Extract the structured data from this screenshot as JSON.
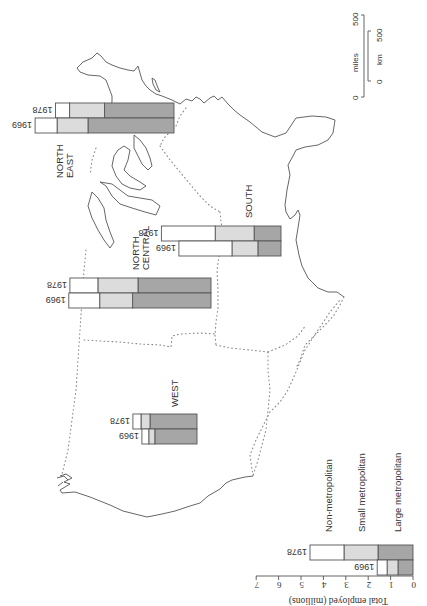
{
  "figure": {
    "orientation": "rotated 90 degrees clockwise (north to the left)",
    "colors": {
      "large_metropolitan": "#a6a6a6",
      "small_metropolitan": "#dcdcdc",
      "non_metropolitan": "#ffffff",
      "outline": "#555555"
    }
  },
  "regions": {
    "north_east": {
      "label_line1": "NORTH",
      "label_line2": "EAST"
    },
    "north_central": {
      "label_line1": "NORTH",
      "label_line2": "CENTRAL"
    },
    "south": {
      "label": "SOUTH"
    },
    "west": {
      "label": "WEST"
    }
  },
  "legend": {
    "items": [
      {
        "label": "Non-metropolitan"
      },
      {
        "label": "Small metropolitan"
      },
      {
        "label": "Large metropolitan"
      }
    ],
    "axis_title": "Total employed (millions)",
    "ticks": [
      "0",
      "1",
      "2",
      "3",
      "4",
      "5",
      "6",
      "7"
    ],
    "year_1969": "1969",
    "year_1978": "1978"
  },
  "scale_bar": {
    "miles_label": "miles",
    "miles_0": "0",
    "miles_500": "500",
    "km_label": "km",
    "km_0": "0",
    "km_500": "500"
  },
  "chart_data": {
    "type": "bar",
    "title": "",
    "xlabel": "",
    "ylabel": "Total employed (millions)",
    "ylim": [
      0,
      7
    ],
    "stacked": true,
    "segments": [
      "Large metropolitan",
      "Small metropolitan",
      "Non-metropolitan"
    ],
    "years": [
      "1969",
      "1978"
    ],
    "groups": [
      {
        "region": "NORTH EAST",
        "bars": [
          {
            "year": "1969",
            "large": 3.84,
            "small": 1.38,
            "non": 0.98,
            "total": 6.2
          },
          {
            "year": "1978",
            "large": 3.1,
            "small": 1.56,
            "non": 0.63,
            "total": 5.3
          }
        ]
      },
      {
        "region": "NORTH CENTRAL",
        "bars": [
          {
            "year": "1969",
            "large": 3.5,
            "small": 1.47,
            "non": 1.38,
            "total": 6.35
          },
          {
            "year": "1978",
            "large": 3.26,
            "small": 1.79,
            "non": 1.25,
            "total": 6.3
          }
        ]
      },
      {
        "region": "SOUTH",
        "bars": [
          {
            "year": "1969",
            "large": 1.03,
            "small": 1.16,
            "non": 2.37,
            "total": 4.56
          },
          {
            "year": "1978",
            "large": 1.2,
            "small": 1.74,
            "non": 2.4,
            "total": 5.34
          }
        ]
      },
      {
        "region": "WEST",
        "bars": [
          {
            "year": "1969",
            "large": 1.88,
            "small": 0.27,
            "non": 0.31,
            "total": 2.46
          },
          {
            "year": "1978",
            "large": 2.1,
            "small": 0.4,
            "non": 0.36,
            "total": 2.86
          }
        ]
      },
      {
        "region": "Legend (key)",
        "bars": [
          {
            "year": "1969",
            "large": 0.67,
            "small": 0.49,
            "non": 0.44,
            "total": 1.6
          },
          {
            "year": "1978",
            "large": 1.56,
            "small": 1.52,
            "non": 1.52,
            "total": 4.6
          }
        ]
      }
    ],
    "legend_position": "bottom-right",
    "grid": false
  }
}
